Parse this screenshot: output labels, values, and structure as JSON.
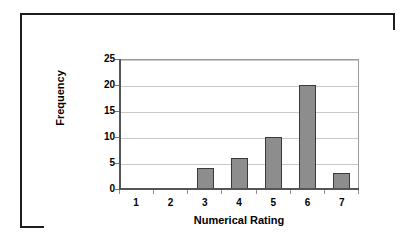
{
  "chart_data": {
    "type": "bar",
    "title": "",
    "xlabel": "Numerical Rating",
    "ylabel": "Frequency",
    "categories": [
      "1",
      "2",
      "3",
      "4",
      "5",
      "6",
      "7"
    ],
    "values": [
      0,
      0,
      4,
      6,
      10,
      20,
      3
    ],
    "series": [
      {
        "name": "Frequency",
        "values": [
          0,
          0,
          4,
          6,
          10,
          20,
          3
        ]
      }
    ],
    "ylim": [
      0,
      25
    ],
    "ytick_step": 5,
    "yticks": [
      "25",
      "20",
      "15",
      "10",
      "5",
      "0"
    ],
    "ytick_values": [
      25,
      20,
      15,
      10,
      5,
      0
    ],
    "grid": "horizontal",
    "legend": "none",
    "bar_color": "#8d8d8d",
    "bar_border_color": "#3a3a3a",
    "gridline_color": "#c9c9c9",
    "axis_color": "#555555",
    "frame_color": "#1d1d1d",
    "background_color": "#ffffff"
  }
}
